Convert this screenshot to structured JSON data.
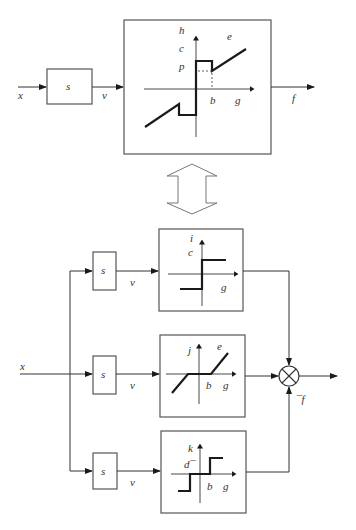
{
  "diagram": {
    "top": {
      "input_label": "x",
      "block_label": "s",
      "signal_label": "v",
      "output_label": "f",
      "nonlinearity": {
        "y_axis_label": "h",
        "x_axis_label": "g",
        "labels": {
          "c": "c",
          "p": "p",
          "e": "e",
          "b": "b"
        }
      }
    },
    "equivalence_arrow": "double-hollow-arrow",
    "bottom": {
      "input_label": "x",
      "output_label": "¯f",
      "branches": [
        {
          "block_label": "s",
          "signal_label": "v",
          "nonlinearity": {
            "type": "relay",
            "y_axis_label": "i",
            "x_axis_label": "g",
            "level_label": "c"
          }
        },
        {
          "block_label": "s",
          "signal_label": "v",
          "nonlinearity": {
            "type": "dead-zone",
            "y_axis_label": "j",
            "x_axis_label": "g",
            "slope_label": "e",
            "threshold_label": "b"
          }
        },
        {
          "block_label": "s",
          "signal_label": "v",
          "nonlinearity": {
            "type": "relay-with-dead-zone",
            "y_axis_label": "k",
            "x_axis_label": "g",
            "level_label": "d¯",
            "threshold_label": "b"
          }
        }
      ],
      "summing_junction": "multiplier-circle"
    }
  }
}
